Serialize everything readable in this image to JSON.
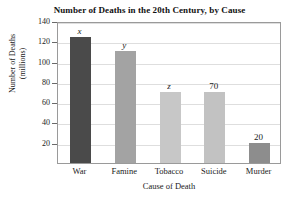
{
  "chart_data": {
    "type": "bar",
    "title": "Number of Deaths in the 20th Century, by Cause",
    "xlabel": "Cause of Death",
    "ylabel_line1": "Number of Deaths",
    "ylabel_line2": "(millions)",
    "ylabel": "Number of Deaths (millions)",
    "categories": [
      "War",
      "Famine",
      "Tobacco",
      "Suicide",
      "Murder"
    ],
    "values": [
      124,
      110,
      70,
      70,
      20
    ],
    "point_labels": [
      "x",
      "y",
      "z",
      "70",
      "20"
    ],
    "point_label_styles": [
      "italic",
      "italic",
      "italic",
      "normal",
      "normal"
    ],
    "bar_colors": [
      "#4a4a4a",
      "#a3a3a3",
      "#c7c7c7",
      "#c2c2c2",
      "#8d8d8d"
    ],
    "ylim": [
      0,
      140
    ],
    "yticks": [
      20,
      40,
      60,
      80,
      100,
      120,
      140
    ],
    "ytick_labels": [
      "20",
      "40",
      "60",
      "80",
      "100",
      "120",
      "140"
    ],
    "grid": true,
    "grid_color": "#dedede",
    "legend": null,
    "legend_position": "none",
    "axis_color": "#9a9a9a",
    "text_color": "#1a1a1a"
  }
}
